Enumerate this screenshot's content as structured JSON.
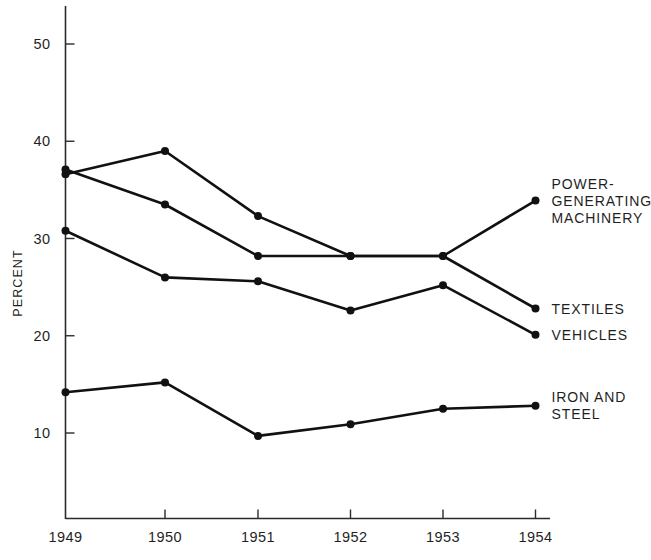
{
  "chart_data": {
    "type": "line",
    "title": "",
    "xlabel": "",
    "ylabel": "PERCENT",
    "categories": [
      "1949",
      "1950",
      "1951",
      "1952",
      "1953",
      "1954"
    ],
    "x": [
      1949,
      1950,
      1951,
      1952,
      1953,
      1954
    ],
    "xlim": [
      1948.9,
      1954.55
    ],
    "ylim": [
      0,
      53
    ],
    "grid": false,
    "legend_position": "right-inline",
    "y_ticks": [
      10,
      20,
      30,
      40,
      50
    ],
    "y_tick_labels": [
      "10",
      "20",
      "30",
      "40",
      "50"
    ],
    "x_ticks": [
      1949,
      1950,
      1951,
      1952,
      1953,
      1954
    ],
    "x_tick_labels": [
      "1949",
      "1950",
      "1951",
      "1952",
      "1953",
      "1954"
    ],
    "marker": "filled-circle",
    "line_color": "#111111",
    "series": [
      {
        "name": "POWER-GENERATING MACHINERY",
        "label_lines": [
          "POWER-",
          "GENERATING",
          "MACHINERY"
        ],
        "values": [
          36.6,
          39.0,
          32.3,
          28.2,
          28.2,
          33.9
        ]
      },
      {
        "name": "TEXTILES",
        "label_lines": [
          "TEXTILES"
        ],
        "values": [
          37.1,
          33.5,
          28.2,
          28.2,
          28.2,
          22.8
        ]
      },
      {
        "name": "VEHICLES",
        "label_lines": [
          "VEHICLES"
        ],
        "values": [
          30.8,
          26.0,
          25.6,
          22.6,
          25.2,
          20.1
        ]
      },
      {
        "name": "IRON AND STEEL",
        "label_lines": [
          "IRON AND",
          "STEEL"
        ],
        "values": [
          14.2,
          15.2,
          9.7,
          10.9,
          12.5,
          12.8
        ]
      }
    ]
  },
  "axis": {
    "y_title": "PERCENT"
  },
  "colors": {
    "ink": "#111111",
    "background": "#ffffff"
  }
}
